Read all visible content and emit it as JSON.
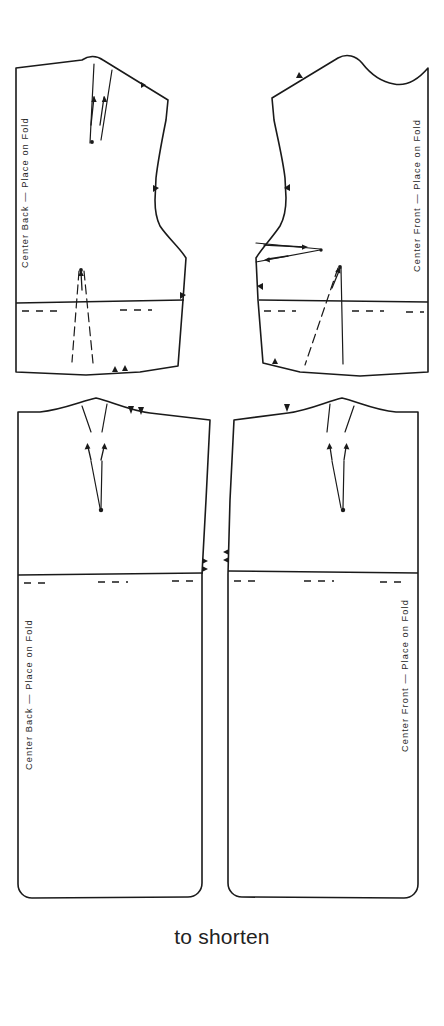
{
  "sheet": {
    "width": 444,
    "height": 1026,
    "background": "#ffffff",
    "ink": "#1a1a1a"
  },
  "caption": {
    "text": "to shorten"
  },
  "pieces": [
    {
      "id": "bodice-back",
      "name": "bodice-back",
      "position": "upper-left",
      "fold_label": "Center Back — Place on Fold",
      "fold_edge": "left",
      "markings": {
        "shoulder_dart": true,
        "waist_dart": true,
        "adjustment_line_label": "lengthen-shorten-line",
        "armhole_notches": 1,
        "side_notches": 1,
        "hem_notches": 2,
        "shoulder_notches": 1
      }
    },
    {
      "id": "bodice-front",
      "name": "bodice-front",
      "position": "upper-right",
      "fold_label": "Center Front — Place on Fold",
      "fold_edge": "right",
      "markings": {
        "bust_dart": true,
        "waist_dart": true,
        "adjustment_line_label": "lengthen-shorten-line",
        "armhole_notches": 1,
        "side_notches": 1,
        "hem_notches": 1,
        "shoulder_notches": 1
      }
    },
    {
      "id": "skirt-back",
      "name": "skirt-back",
      "position": "lower-left",
      "fold_label": "Center Back — Place on Fold",
      "fold_edge": "left",
      "markings": {
        "waist_dart": true,
        "adjustment_line_label": "lengthen-shorten-line",
        "waist_notches": 2,
        "side_notches": 2,
        "hem_corners": "rounded"
      }
    },
    {
      "id": "skirt-front",
      "name": "skirt-front",
      "position": "lower-right",
      "fold_label": "Center Front — Place on Fold",
      "fold_edge": "right",
      "markings": {
        "waist_dart": true,
        "adjustment_line_label": "lengthen-shorten-line",
        "waist_notches": 1,
        "side_notches": 2,
        "hem_corners": "rounded"
      }
    }
  ]
}
